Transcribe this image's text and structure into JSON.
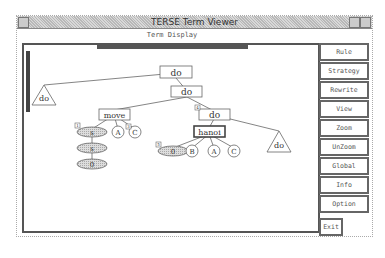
{
  "window": {
    "title": "TERSE Term Viewer",
    "subtitle": "Term Display"
  },
  "sidebar": {
    "buttons": [
      {
        "label": "Rule"
      },
      {
        "label": "Strategy"
      },
      {
        "label": "Rewrite"
      },
      {
        "label": "View"
      },
      {
        "label": "Zoom"
      },
      {
        "label": "UnZoom"
      },
      {
        "label": "Global"
      },
      {
        "label": "Info"
      },
      {
        "label": "Option"
      }
    ],
    "exit_label": "Exit"
  },
  "tree": {
    "nodes": {
      "root": {
        "label": "do",
        "shape": "box"
      },
      "left_collapsed": {
        "label": "do",
        "shape": "triangle"
      },
      "do2": {
        "label": "do",
        "shape": "box"
      },
      "move": {
        "label": "move",
        "shape": "box"
      },
      "do3": {
        "label": "do",
        "shape": "box",
        "badge": "4"
      },
      "s1": {
        "label": "s",
        "shape": "ellipse-shaded",
        "badge": "1"
      },
      "a1": {
        "label": "A",
        "shape": "circle"
      },
      "c1": {
        "label": "C",
        "shape": "circle",
        "badge": "3"
      },
      "s2": {
        "label": "s",
        "shape": "ellipse-shaded"
      },
      "zero1": {
        "label": "0",
        "shape": "ellipse-shaded"
      },
      "hanoi": {
        "label": "hanoi",
        "shape": "box-double"
      },
      "right_collapsed": {
        "label": "do",
        "shape": "triangle"
      },
      "zero2": {
        "label": "0",
        "shape": "ellipse-shaded",
        "badge": "5"
      },
      "b2": {
        "label": "B",
        "shape": "circle"
      },
      "a2": {
        "label": "A",
        "shape": "circle"
      },
      "c2": {
        "label": "C",
        "shape": "circle"
      }
    }
  }
}
